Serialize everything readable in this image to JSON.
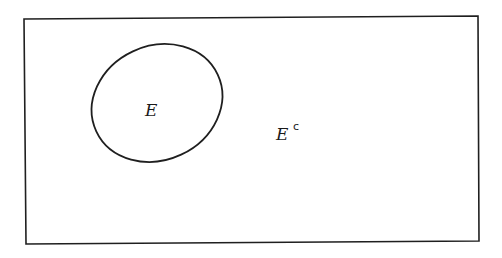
{
  "diagram": {
    "type": "venn",
    "universe": {
      "shape": "rectangle",
      "corners": [
        [
          24,
          19
        ],
        [
          478,
          16
        ],
        [
          479,
          241
        ],
        [
          26,
          244
        ]
      ],
      "stroke": "#1f1f1f"
    },
    "sets": [
      {
        "name": "E",
        "label": "E",
        "shape": "ellipse",
        "cx": 157,
        "cy": 103,
        "rx": 67,
        "ry": 57,
        "rotation": -25,
        "stroke": "#1f1f1f"
      }
    ],
    "complement": {
      "label_base": "E",
      "label_superscript": "c"
    }
  }
}
